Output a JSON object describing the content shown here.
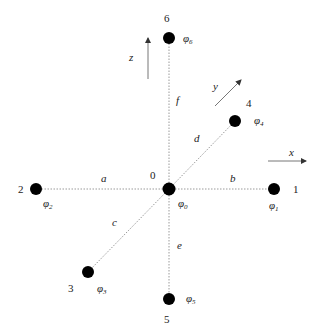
{
  "diagram": {
    "type": "finite-difference stencil",
    "colors": {
      "node": "#000000",
      "edge": "#9a9a9a",
      "text": "#222222",
      "arrow": "#555555"
    },
    "nodes": [
      {
        "id": "0",
        "label": "0",
        "phi": "φ",
        "phi_sub": "0",
        "x": 169,
        "y": 189
      },
      {
        "id": "1",
        "label": "1",
        "phi": "φ",
        "phi_sub": "1",
        "x": 274,
        "y": 189
      },
      {
        "id": "2",
        "label": "2",
        "phi": "φ",
        "phi_sub": "2",
        "x": 36,
        "y": 189
      },
      {
        "id": "3",
        "label": "3",
        "phi": "φ",
        "phi_sub": "3",
        "x": 88,
        "y": 272
      },
      {
        "id": "4",
        "label": "4",
        "phi": "φ",
        "phi_sub": "4",
        "x": 235,
        "y": 121
      },
      {
        "id": "5",
        "label": "5",
        "phi": "φ",
        "phi_sub": "5",
        "x": 169,
        "y": 299
      },
      {
        "id": "6",
        "label": "6",
        "phi": "φ",
        "phi_sub": "6",
        "x": 169,
        "y": 38
      }
    ],
    "edges": [
      {
        "label": "a",
        "from": "0",
        "to": "2"
      },
      {
        "label": "b",
        "from": "0",
        "to": "1"
      },
      {
        "label": "c",
        "from": "0",
        "to": "3"
      },
      {
        "label": "d",
        "from": "0",
        "to": "4"
      },
      {
        "label": "e",
        "from": "0",
        "to": "5"
      },
      {
        "label": "f",
        "from": "0",
        "to": "6"
      }
    ],
    "axes": [
      {
        "label": "x"
      },
      {
        "label": "y"
      },
      {
        "label": "z"
      }
    ]
  }
}
